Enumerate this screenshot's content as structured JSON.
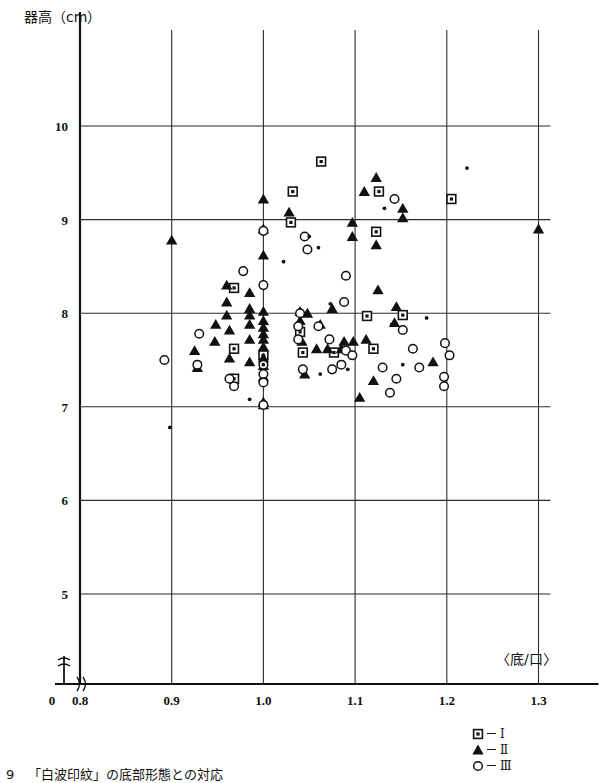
{
  "figure": {
    "y_axis_title": "器高（cm）",
    "x_axis_title": "〈底/口〉",
    "caption_number": "9",
    "caption_text": "「白波印紋」の底部形態との対応"
  },
  "legend": {
    "position": "bottom-right",
    "entries": [
      {
        "marker": "square-dot",
        "label": "Ⅰ"
      },
      {
        "marker": "filled-triangle",
        "label": "Ⅱ"
      },
      {
        "marker": "open-circle",
        "label": "Ⅲ"
      }
    ]
  },
  "chart_data": {
    "type": "scatter",
    "title": "",
    "xlabel": "〈底/口〉",
    "ylabel": "器高（cm）",
    "xlim": [
      0.75,
      1.35
    ],
    "ylim": [
      4.6,
      10.55
    ],
    "xticks": [
      0.8,
      0.9,
      1.0,
      1.1,
      1.2,
      1.3
    ],
    "xtick_labels": [
      "0.8",
      "0.9",
      "1.0",
      "1.1",
      "1.2",
      "1.3"
    ],
    "yticks": [
      5,
      6,
      7,
      8,
      9,
      10
    ],
    "ytick_labels": [
      "5",
      "6",
      "7",
      "8",
      "9",
      "10"
    ],
    "origin_label": "0",
    "axis_break": true,
    "grid": true,
    "series": [
      {
        "name": "Ⅰ",
        "marker": "square-dot",
        "points": [
          [
            1.063,
            9.62
          ],
          [
            1.032,
            9.3
          ],
          [
            1.03,
            8.97
          ],
          [
            1.126,
            9.3
          ],
          [
            1.123,
            8.87
          ],
          [
            1.205,
            9.22
          ],
          [
            0.968,
            8.27
          ],
          [
            0.968,
            7.62
          ],
          [
            0.968,
            7.3
          ],
          [
            1.04,
            7.8
          ],
          [
            1.043,
            7.58
          ],
          [
            1.077,
            7.58
          ],
          [
            1.113,
            7.97
          ],
          [
            1.152,
            7.98
          ],
          [
            1.12,
            7.62
          ],
          [
            1.0,
            7.55
          ]
        ]
      },
      {
        "name": "Ⅱ",
        "marker": "filled-triangle",
        "points": [
          [
            1.0,
            9.22
          ],
          [
            1.028,
            9.08
          ],
          [
            1.123,
            9.45
          ],
          [
            1.11,
            9.3
          ],
          [
            1.152,
            9.12
          ],
          [
            1.152,
            9.02
          ],
          [
            1.097,
            8.97
          ],
          [
            1.3,
            8.9
          ],
          [
            0.9,
            8.78
          ],
          [
            1.0,
            8.9
          ],
          [
            1.097,
            8.82
          ],
          [
            1.123,
            8.73
          ],
          [
            1.0,
            8.62
          ],
          [
            0.96,
            8.3
          ],
          [
            0.985,
            8.22
          ],
          [
            0.96,
            8.12
          ],
          [
            0.985,
            8.05
          ],
          [
            0.96,
            7.98
          ],
          [
            0.985,
            7.98
          ],
          [
            1.0,
            8.02
          ],
          [
            1.0,
            7.92
          ],
          [
            1.04,
            8.02
          ],
          [
            1.048,
            8.0
          ],
          [
            1.075,
            8.05
          ],
          [
            1.125,
            8.25
          ],
          [
            1.145,
            8.07
          ],
          [
            0.948,
            7.88
          ],
          [
            0.963,
            7.82
          ],
          [
            0.985,
            7.88
          ],
          [
            1.0,
            7.85
          ],
          [
            1.0,
            7.78
          ],
          [
            1.04,
            7.92
          ],
          [
            1.062,
            7.88
          ],
          [
            1.143,
            7.9
          ],
          [
            0.947,
            7.7
          ],
          [
            0.985,
            7.72
          ],
          [
            1.0,
            7.72
          ],
          [
            1.0,
            7.64
          ],
          [
            1.042,
            7.7
          ],
          [
            1.088,
            7.7
          ],
          [
            1.098,
            7.7
          ],
          [
            1.112,
            7.72
          ],
          [
            1.058,
            7.62
          ],
          [
            1.07,
            7.62
          ],
          [
            1.085,
            7.62
          ],
          [
            0.963,
            7.52
          ],
          [
            0.985,
            7.48
          ],
          [
            1.0,
            7.52
          ],
          [
            1.0,
            7.44
          ],
          [
            1.045,
            7.35
          ],
          [
            1.185,
            7.48
          ],
          [
            1.0,
            7.32
          ],
          [
            1.12,
            7.28
          ],
          [
            1.105,
            7.1
          ],
          [
            0.925,
            7.6
          ],
          [
            0.928,
            7.42
          ],
          [
            1.0,
            7.05
          ],
          [
            1.0,
            7.02
          ]
        ]
      },
      {
        "name": "Ⅲ",
        "marker": "open-circle",
        "points": [
          [
            1.045,
            8.82
          ],
          [
            1.048,
            8.68
          ],
          [
            1.143,
            9.22
          ],
          [
            0.978,
            8.45
          ],
          [
            1.0,
            8.88
          ],
          [
            1.09,
            8.4
          ],
          [
            1.0,
            8.3
          ],
          [
            1.088,
            8.12
          ],
          [
            0.93,
            7.78
          ],
          [
            0.892,
            7.5
          ],
          [
            0.928,
            7.45
          ],
          [
            1.0,
            7.45
          ],
          [
            1.0,
            7.35
          ],
          [
            1.0,
            7.26
          ],
          [
            1.04,
            8.0
          ],
          [
            1.038,
            7.86
          ],
          [
            1.06,
            7.86
          ],
          [
            1.038,
            7.72
          ],
          [
            1.072,
            7.72
          ],
          [
            1.09,
            7.6
          ],
          [
            1.043,
            7.4
          ],
          [
            1.075,
            7.4
          ],
          [
            1.152,
            7.82
          ],
          [
            1.163,
            7.62
          ],
          [
            1.198,
            7.68
          ],
          [
            1.203,
            7.55
          ],
          [
            1.17,
            7.42
          ],
          [
            1.13,
            7.42
          ],
          [
            1.145,
            7.3
          ],
          [
            1.197,
            7.32
          ],
          [
            1.197,
            7.22
          ],
          [
            1.138,
            7.15
          ],
          [
            0.968,
            7.22
          ],
          [
            0.963,
            7.3
          ],
          [
            1.0,
            7.02
          ],
          [
            1.097,
            7.55
          ],
          [
            1.085,
            7.45
          ]
        ]
      },
      {
        "name": "small-dot",
        "marker": "small-dot",
        "points": [
          [
            1.05,
            8.82
          ],
          [
            1.06,
            8.7
          ],
          [
            1.022,
            8.55
          ],
          [
            1.132,
            9.12
          ],
          [
            1.222,
            9.55
          ],
          [
            1.073,
            8.1
          ],
          [
            1.14,
            7.88
          ],
          [
            1.062,
            7.35
          ],
          [
            1.092,
            7.4
          ],
          [
            1.152,
            7.45
          ],
          [
            0.985,
            7.08
          ],
          [
            1.0,
            7.45
          ],
          [
            0.898,
            6.78
          ],
          [
            1.178,
            7.95
          ],
          [
            1.0,
            7.55
          ]
        ]
      }
    ]
  }
}
